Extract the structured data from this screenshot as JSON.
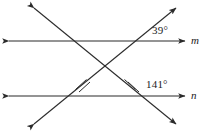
{
  "figure": {
    "type": "two-parallel-lines-cut-by-two-transversals",
    "stroke_color": "#2b2b2b",
    "background_color": "#ffffff",
    "parallel_lines": [
      {
        "name": "line-m",
        "label": "m",
        "y": 41,
        "x_start": 8,
        "x_end": 186,
        "arrow_left": true,
        "arrow_right": true
      },
      {
        "name": "line-n",
        "label": "n",
        "y": 96,
        "x_start": 8,
        "x_end": 186,
        "arrow_left": true,
        "arrow_right": true
      }
    ],
    "transversals": [
      {
        "name": "transversal-up-right",
        "x1": 34,
        "y1": 124,
        "x2": 176,
        "y2": 8,
        "arrow_start": true,
        "arrow_end": true,
        "tick_marks": 2,
        "tick_position_label": "between-lines-near-n"
      },
      {
        "name": "transversal-down-right",
        "x1": 34,
        "y1": 8,
        "x2": 176,
        "y2": 124,
        "arrow_start": true,
        "arrow_end": true,
        "tick_marks": 2,
        "tick_position_label": "between-lines-near-n"
      }
    ],
    "angles": [
      {
        "name": "angle-top-right",
        "value": "39°",
        "at_line": "m",
        "position": "above-line-m-right-intersection"
      },
      {
        "name": "angle-bottom-right",
        "value": "141°",
        "at_line": "n",
        "position": "above-line-n-right-intersection"
      }
    ],
    "intersections": [
      {
        "name": "m-left",
        "x": 80,
        "y": 41
      },
      {
        "name": "m-right",
        "x": 135,
        "y": 41
      },
      {
        "name": "center-x",
        "x": 105,
        "y": 66
      },
      {
        "name": "n-left",
        "x": 54,
        "y": 96
      },
      {
        "name": "n-right",
        "x": 160,
        "y": 96
      }
    ]
  },
  "labels": {
    "angle_top": "39°",
    "angle_bottom": "141°",
    "line_m": "m",
    "line_n": "n"
  }
}
